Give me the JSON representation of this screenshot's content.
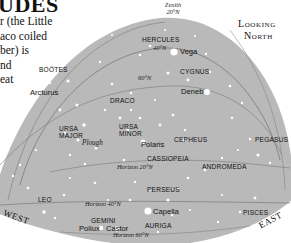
{
  "heading": {
    "title_fragment": "UDES",
    "intro_lines": [
      "r (the Little",
      "aco coiled",
      "ber) is",
      "nd",
      "eat"
    ]
  },
  "orientation": {
    "line1": "Looking",
    "line2": "North"
  },
  "directions": {
    "west": "WEST",
    "east": "EAST"
  },
  "zenith": {
    "line1": "Zenith",
    "line2": "20°N"
  },
  "latitude_arcs": [
    {
      "label": "40°N",
      "position": "under-hercules"
    },
    {
      "label": "60°N",
      "position": "upper-middle"
    },
    {
      "label": "Horizon 20°N",
      "position": "middle"
    },
    {
      "label": "Horizon 40°N",
      "position": "lower"
    },
    {
      "label": "Horizon 60°N",
      "position": "bottom"
    }
  ],
  "constellations": [
    {
      "name": "HERCULES"
    },
    {
      "name": "BOÖTES"
    },
    {
      "name": "CYGNUS"
    },
    {
      "name": "DRACO"
    },
    {
      "name": "URSA MAJOR"
    },
    {
      "name": "URSA MINOR"
    },
    {
      "name": "CEPHEUS"
    },
    {
      "name": "PEGASUS"
    },
    {
      "name": "CASSIOPEIA"
    },
    {
      "name": "ANDROMEDA"
    },
    {
      "name": "PERSEUS"
    },
    {
      "name": "LEO"
    },
    {
      "name": "PISCES"
    },
    {
      "name": "GEMINI"
    },
    {
      "name": "AURIGA"
    }
  ],
  "stars": [
    {
      "name": "Vega"
    },
    {
      "name": "Arcturus"
    },
    {
      "name": "Deneb"
    },
    {
      "name": "Polaris"
    },
    {
      "name": "Capella"
    },
    {
      "name": "Pollux"
    },
    {
      "name": "Castor"
    }
  ],
  "asterisms": [
    {
      "name": "Plough"
    }
  ],
  "colors": {
    "sky": "#b9b9b9",
    "arc": "#7a7a7a",
    "star": "#ffffff",
    "text": "#111111"
  }
}
